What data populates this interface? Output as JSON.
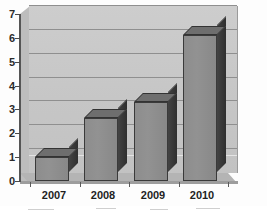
{
  "chart_data": {
    "type": "bar",
    "title": "",
    "subtitle": "",
    "xlabel": "",
    "ylabel": "",
    "categories": [
      "2007",
      "2008",
      "2009",
      "2010"
    ],
    "values": [
      1.0,
      2.65,
      3.3,
      6.1
    ],
    "series": [
      {
        "name": "",
        "values": [
          1.0,
          2.65,
          3.3,
          6.1
        ]
      }
    ],
    "ylim": [
      0,
      7
    ],
    "yticks": [
      "0",
      "1",
      "2",
      "3",
      "4",
      "5",
      "6",
      "7"
    ],
    "ytick_values": [
      0,
      1,
      2,
      3,
      4,
      5,
      6,
      7
    ],
    "grid": true,
    "grid_axis": "y",
    "legend": false,
    "legend_position": "none",
    "style": "3d-column",
    "annotations": []
  },
  "colors": {
    "plot_background": "#c6c6c6",
    "bar_face": "#8d8d8d",
    "bar_side": "#3c3c3c",
    "bar_top": "#6e6e6e",
    "gridline": "#8f8f8f",
    "axis": "#555555",
    "tick_label": "#1f1f1f",
    "page_background": "#fdfdfd",
    "floor": "#b4b4b4"
  },
  "axes": {
    "y": {
      "tick_labels": [
        "7",
        "6",
        "5",
        "4",
        "3",
        "2",
        "1",
        "0"
      ]
    },
    "x": {
      "tick_labels": [
        "2007",
        "2008",
        "2009",
        "2010"
      ]
    }
  }
}
